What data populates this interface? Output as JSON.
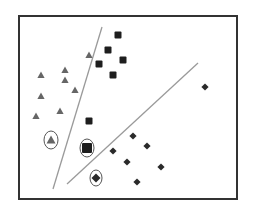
{
  "diagram": {
    "type": "svm-classification-scatter",
    "frame": {
      "x": 19,
      "y": 16,
      "width": 218,
      "height": 183,
      "stroke": "#333333"
    },
    "colors": {
      "triangle": "#666666",
      "square": "#1e1e1e",
      "diamond": "#2a2a2a",
      "boundary": "#9a9a9a",
      "circle": "#555555"
    },
    "boundaries": [
      {
        "name": "boundary-line-1",
        "x1": 102,
        "y1": 27,
        "x2": 53,
        "y2": 189
      },
      {
        "name": "boundary-line-2",
        "x1": 198,
        "y1": 63,
        "x2": 67,
        "y2": 184
      }
    ],
    "classes": {
      "triangles": [
        {
          "x": 41,
          "y": 75
        },
        {
          "x": 65,
          "y": 70
        },
        {
          "x": 65,
          "y": 80
        },
        {
          "x": 75,
          "y": 90
        },
        {
          "x": 41,
          "y": 96
        },
        {
          "x": 60,
          "y": 111
        },
        {
          "x": 36,
          "y": 116
        },
        {
          "x": 89,
          "y": 55
        }
      ],
      "squares": [
        {
          "x": 118,
          "y": 35
        },
        {
          "x": 108,
          "y": 50
        },
        {
          "x": 123,
          "y": 60
        },
        {
          "x": 99,
          "y": 64
        },
        {
          "x": 113,
          "y": 75
        },
        {
          "x": 89,
          "y": 121
        }
      ],
      "diamonds": [
        {
          "x": 205,
          "y": 87
        },
        {
          "x": 133,
          "y": 136
        },
        {
          "x": 147,
          "y": 146
        },
        {
          "x": 113,
          "y": 151
        },
        {
          "x": 127,
          "y": 162
        },
        {
          "x": 161,
          "y": 167
        },
        {
          "x": 137,
          "y": 182
        }
      ]
    },
    "circled_points": [
      {
        "shape": "triangle",
        "x": 51,
        "y": 140,
        "rx": 7,
        "ry": 9
      },
      {
        "shape": "square",
        "x": 87,
        "y": 148,
        "rx": 7,
        "ry": 9
      },
      {
        "shape": "diamond",
        "x": 96,
        "y": 178,
        "rx": 6,
        "ry": 8
      }
    ]
  }
}
